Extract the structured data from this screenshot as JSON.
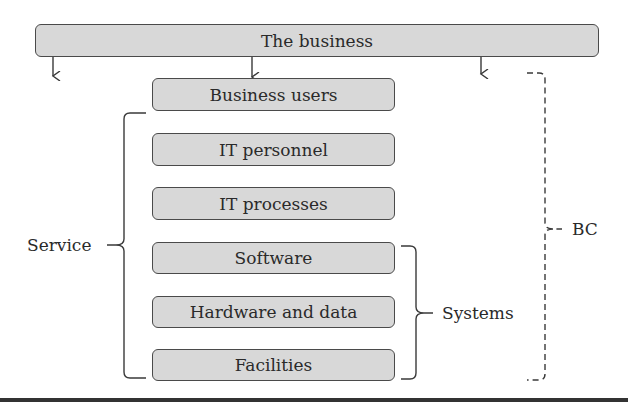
{
  "diagram": {
    "top_box": {
      "label": "The business"
    },
    "stack": [
      {
        "label": "Business users"
      },
      {
        "label": "IT personnel"
      },
      {
        "label": "IT processes"
      },
      {
        "label": "Software"
      },
      {
        "label": "Hardware and data"
      },
      {
        "label": "Facilities"
      }
    ],
    "braces": {
      "service": {
        "label": "Service",
        "covers": [
          "IT personnel",
          "IT processes",
          "Software",
          "Hardware and data",
          "Facilities"
        ],
        "style": "solid"
      },
      "systems": {
        "label": "Systems",
        "covers": [
          "Software",
          "Hardware and data",
          "Facilities"
        ],
        "style": "solid"
      },
      "bc": {
        "label": "BC",
        "covers": [
          "Business users",
          "IT personnel",
          "IT processes",
          "Software",
          "Hardware and data",
          "Facilities"
        ],
        "style": "dashed"
      }
    },
    "arrows": {
      "count": 3,
      "from": "The business",
      "direction": "down"
    },
    "colors": {
      "box_fill": "#d8d8d8",
      "box_border": "#4a4a4a",
      "text": "#2a2a2a",
      "rule": "#333333"
    }
  }
}
